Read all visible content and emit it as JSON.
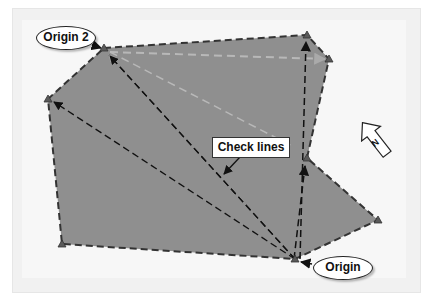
{
  "diagram": {
    "type": "survey-traverse",
    "labels": {
      "origin2": "Origin 2",
      "origin": "Origin",
      "check_lines": "Check lines",
      "north": "N"
    },
    "colors": {
      "polygon_fill": "#8f8f8f",
      "polygon_edge": "#333333",
      "check_line": "#111111",
      "secondary_line": "#b5b5b5",
      "background": "#f4f4f4",
      "vertex": "#5a5a5a"
    },
    "vertices": [
      {
        "id": "origin2",
        "x": 104,
        "y": 48
      },
      {
        "id": "v-top-right",
        "x": 307,
        "y": 35
      },
      {
        "id": "v-right",
        "x": 329,
        "y": 59
      },
      {
        "id": "v-inner-right",
        "x": 307,
        "y": 158
      },
      {
        "id": "v-far-right",
        "x": 378,
        "y": 220
      },
      {
        "id": "origin",
        "x": 295,
        "y": 259
      },
      {
        "id": "v-bottom-left",
        "x": 62,
        "y": 244
      },
      {
        "id": "v-left",
        "x": 48,
        "y": 99
      }
    ],
    "check_lines": [
      {
        "from": "origin",
        "to": "origin2"
      },
      {
        "from": "origin",
        "to": "v-left"
      },
      {
        "from": "origin",
        "to": "v-top-right"
      },
      {
        "from": "origin",
        "to": "v-inner-right"
      }
    ],
    "secondary_lines": [
      {
        "from": "origin2",
        "to": "v-right"
      },
      {
        "from": "origin2",
        "to": "check-label"
      }
    ]
  }
}
